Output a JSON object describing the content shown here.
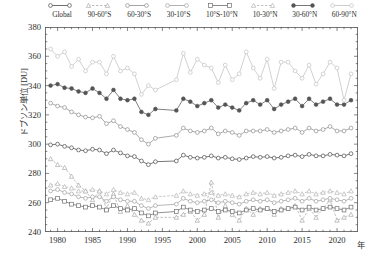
{
  "chart_data": {
    "type": "line",
    "title": "",
    "subtitle": "",
    "xlabel": "年",
    "ylabel": "ドブソン単位 [DU]",
    "xlim": [
      1978.2,
      2023.0
    ],
    "ylim": [
      240,
      380
    ],
    "yticks": [
      240,
      260,
      280,
      300,
      320,
      340,
      360,
      380
    ],
    "xticks": [
      1980,
      1985,
      1990,
      1995,
      2000,
      2005,
      2010,
      2015,
      2020
    ],
    "minor_tick_interval": 1,
    "grid": false,
    "legend_position": "top",
    "data_gap_years": [
      1995,
      1996
    ],
    "x": [
      1979,
      1980,
      1981,
      1982,
      1983,
      1984,
      1985,
      1986,
      1987,
      1988,
      1989,
      1990,
      1991,
      1992,
      1993,
      1994,
      1997,
      1998,
      1999,
      2000,
      2001,
      2002,
      2003,
      2004,
      2005,
      2006,
      2007,
      2008,
      2009,
      2010,
      2011,
      2012,
      2013,
      2014,
      2015,
      2016,
      2017,
      2018,
      2019,
      2020,
      2021,
      2022
    ],
    "series": [
      {
        "name": "Global",
        "marker": "circle-open",
        "linestyle": "solid",
        "color": "#4a4a4a",
        "values": [
          299.5,
          300.0,
          298.5,
          297.5,
          296.0,
          295.5,
          296.5,
          296.0,
          293.5,
          296.0,
          294.0,
          292.0,
          291.5,
          288.5,
          286.0,
          288.0,
          288.5,
          292.5,
          291.0,
          290.5,
          291.0,
          292.0,
          290.5,
          291.0,
          290.0,
          289.5,
          290.5,
          291.5,
          291.0,
          291.5,
          290.5,
          291.0,
          292.0,
          292.5,
          291.5,
          293.0,
          292.0,
          292.0,
          293.0,
          292.5,
          292.0,
          293.5
        ]
      },
      {
        "name": "90-60°S",
        "marker": "triangle-open",
        "linestyle": "dashed",
        "color": "#a9a9a9",
        "values": [
          290.0,
          286.0,
          284.0,
          278.0,
          272.0,
          268.0,
          262.0,
          268.0,
          256.0,
          266.0,
          254.0,
          258.0,
          252.0,
          248.0,
          246.0,
          250.0,
          250.0,
          252.0,
          254.0,
          248.0,
          252.0,
          274.0,
          250.0,
          258.0,
          252.0,
          248.0,
          256.0,
          252.0,
          256.0,
          256.0,
          252.0,
          256.0,
          256.0,
          258.0,
          248.0,
          256.0,
          250.0,
          256.0,
          262.0,
          248.0,
          250.0,
          252.0
        ]
      },
      {
        "name": "60-30°S",
        "marker": "circle-open",
        "linestyle": "solid",
        "color": "#8e8e8e",
        "values": [
          328.0,
          326.0,
          325.0,
          322.0,
          320.0,
          318.5,
          318.0,
          319.0,
          314.0,
          316.0,
          312.0,
          310.0,
          308.0,
          303.0,
          300.0,
          304.0,
          306.0,
          311.0,
          309.0,
          308.0,
          309.0,
          311.0,
          307.0,
          309.0,
          308.0,
          306.0,
          309.0,
          309.0,
          309.0,
          310.0,
          308.0,
          309.0,
          310.0,
          311.0,
          308.0,
          311.0,
          309.0,
          310.0,
          312.0,
          309.0,
          309.0,
          311.0
        ]
      },
      {
        "name": "30-10°S",
        "marker": "circle-open",
        "linestyle": "solid",
        "color": "#a0a0a0",
        "values": [
          268.0,
          269.0,
          267.0,
          266.0,
          264.0,
          263.0,
          264.0,
          264.0,
          261.0,
          264.0,
          262.0,
          261.0,
          261.0,
          258.0,
          256.0,
          258.0,
          259.0,
          263.0,
          261.0,
          260.0,
          261.0,
          262.0,
          260.0,
          261.0,
          260.0,
          259.0,
          261.0,
          262.0,
          261.0,
          262.0,
          260.0,
          261.0,
          262.0,
          263.0,
          261.0,
          263.0,
          261.0,
          262.0,
          263.0,
          262.0,
          261.0,
          263.0
        ]
      },
      {
        "name": "10°S-10°N",
        "marker": "square-open",
        "linestyle": "solid",
        "color": "#6e6e6e",
        "values": [
          262.0,
          263.0,
          261.0,
          259.0,
          258.0,
          257.0,
          258.0,
          257.0,
          255.0,
          258.0,
          256.0,
          255.0,
          256.0,
          253.0,
          251.0,
          253.0,
          254.0,
          257.0,
          255.0,
          254.0,
          255.0,
          256.0,
          254.0,
          255.0,
          254.0,
          253.0,
          255.0,
          256.0,
          255.0,
          256.0,
          254.0,
          255.0,
          256.0,
          257.0,
          255.0,
          257.0,
          255.0,
          256.0,
          257.0,
          256.0,
          255.0,
          257.0
        ]
      },
      {
        "name": "10-30°N",
        "marker": "triangle-open",
        "linestyle": "dashed",
        "color": "#b4b4b4",
        "values": [
          272.0,
          273.0,
          271.0,
          270.0,
          268.0,
          268.0,
          269.0,
          268.0,
          266.0,
          269.0,
          267.0,
          266.0,
          267.0,
          263.0,
          262.0,
          264.0,
          265.0,
          268.0,
          266.0,
          265.0,
          266.0,
          267.0,
          265.0,
          266.0,
          265.0,
          264.0,
          266.0,
          267.0,
          266.0,
          267.0,
          265.0,
          266.0,
          267.0,
          268.0,
          266.0,
          268.0,
          266.0,
          267.0,
          268.0,
          267.0,
          266.0,
          268.0
        ]
      },
      {
        "name": "30-60°N",
        "marker": "circle-filled",
        "linestyle": "solid",
        "color": "#555555",
        "values": [
          340.0,
          341.0,
          338.5,
          338.0,
          336.0,
          335.0,
          338.0,
          335.0,
          331.0,
          337.0,
          331.0,
          330.0,
          331.0,
          322.0,
          320.0,
          324.0,
          323.0,
          331.0,
          329.0,
          326.0,
          328.0,
          330.0,
          325.0,
          327.0,
          325.0,
          323.0,
          328.0,
          330.0,
          327.0,
          330.0,
          324.0,
          327.0,
          329.0,
          331.0,
          326.0,
          331.0,
          327.0,
          329.0,
          331.0,
          327.0,
          327.0,
          330.0
        ]
      },
      {
        "name": "60-90°N",
        "marker": "circle-open",
        "linestyle": "solid",
        "color": "#c2c2c2",
        "values": [
          365.0,
          360.0,
          363.0,
          353.0,
          358.0,
          350.0,
          356.0,
          356.0,
          348.0,
          360.0,
          350.0,
          352.0,
          348.0,
          334.0,
          340.0,
          337.0,
          344.0,
          362.0,
          349.0,
          358.0,
          354.0,
          352.0,
          342.0,
          354.0,
          344.0,
          348.0,
          363.0,
          352.0,
          345.0,
          358.0,
          338.0,
          356.0,
          356.0,
          350.0,
          345.0,
          354.0,
          341.0,
          348.0,
          356.0,
          352.0,
          330.0,
          348.0
        ]
      }
    ]
  },
  "legend": {
    "items": [
      {
        "label": "Global"
      },
      {
        "label": "90-60°S"
      },
      {
        "label": "60-30°S"
      },
      {
        "label": "30-10°S"
      },
      {
        "label": "10°S-10°N"
      },
      {
        "label": "10-30°N"
      },
      {
        "label": "30-60°N"
      },
      {
        "label": "60-90°N"
      }
    ]
  },
  "axes": {
    "ylabel": "ドブソン単位 [DU]",
    "xlabel": "年",
    "ytick_labels": [
      "380",
      "360",
      "340",
      "320",
      "300",
      "280",
      "260",
      "240"
    ],
    "xtick_labels": [
      "1980",
      "1985",
      "1990",
      "1995",
      "2000",
      "2005",
      "2010",
      "2015",
      "2020"
    ]
  }
}
